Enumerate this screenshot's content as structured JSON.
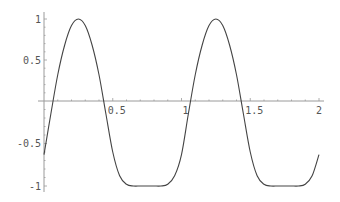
{
  "chart_data": {
    "type": "line",
    "title": "",
    "xlabel": "",
    "ylabel": "",
    "xlim": [
      0,
      2
    ],
    "ylim": [
      -1,
      1
    ],
    "grid": false,
    "legend": null,
    "x_ticks": [
      0.5,
      1,
      1.5,
      2
    ],
    "x_tick_labels": [
      "0.5",
      "1",
      "1.5",
      "2"
    ],
    "y_ticks": [
      -1,
      -0.5,
      0.5,
      1
    ],
    "y_tick_labels": [
      "-1",
      "-0.5",
      "0.5",
      "1"
    ],
    "series": [
      {
        "name": "f(x)",
        "color": "#444444",
        "x": [
          0,
          0.05,
          0.1,
          0.15,
          0.2,
          0.25,
          0.3,
          0.35,
          0.4,
          0.45,
          0.5,
          0.55,
          0.6,
          0.65,
          0.7,
          0.75,
          0.8,
          0.85,
          0.9,
          0.95,
          1.0,
          1.05,
          1.1,
          1.15,
          1.2,
          1.25,
          1.3,
          1.35,
          1.4,
          1.45,
          1.5,
          1.55,
          1.6,
          1.65,
          1.7,
          1.75,
          1.8,
          1.85,
          1.9,
          1.95,
          2.0
        ],
        "y": [
          -0.63,
          -0.15,
          0.32,
          0.68,
          0.92,
          1.0,
          0.92,
          0.68,
          0.32,
          -0.15,
          -0.6,
          -0.88,
          -0.98,
          -1.0,
          -1.0,
          -1.0,
          -1.0,
          -1.0,
          -0.98,
          -0.88,
          -0.63,
          -0.15,
          0.32,
          0.68,
          0.92,
          1.0,
          0.92,
          0.68,
          0.32,
          -0.15,
          -0.6,
          -0.88,
          -0.98,
          -1.0,
          -1.0,
          -1.0,
          -1.0,
          -1.0,
          -0.98,
          -0.88,
          -0.63
        ]
      }
    ]
  }
}
